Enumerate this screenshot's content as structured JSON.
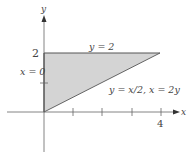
{
  "diagram": {
    "type": "region-of-integration",
    "axes": {
      "x_label": "x",
      "y_label": "y",
      "x_ticks": [
        1,
        2,
        3,
        4
      ],
      "y_ticks": [
        1,
        2
      ],
      "x_tick_labels": {
        "4": "4"
      },
      "y_tick_labels": {
        "2": "2"
      }
    },
    "region": {
      "vertices": [
        [
          0,
          0
        ],
        [
          0,
          2
        ],
        [
          4,
          2
        ]
      ],
      "fill_color": "#d4d4d4",
      "edge_color": "#555555"
    },
    "boundary_labels": {
      "top": "y = 2",
      "left": "x = 0",
      "diagonal": "y = x/2, x = 2y"
    },
    "tick_text": {
      "x4": "4",
      "y2": "2"
    }
  }
}
